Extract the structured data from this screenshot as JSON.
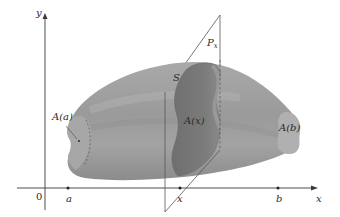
{
  "figure": {
    "type": "solid-with-cross-section",
    "colors": {
      "background": "#ffffff",
      "solid_body": "#9c9c9c",
      "solid_highlight": "#b4b4b4",
      "solid_shadow": "#858585",
      "cross_section": "#7a7a7a",
      "cross_section_light": "#a8a8a8",
      "end_caps": "#aaaaaa",
      "axes": "#3a3a3a",
      "plane_edges": "#555555"
    }
  },
  "axes": {
    "x_label": "x",
    "y_label": "y",
    "origin_label": "0"
  },
  "ticks": [
    {
      "label": "a"
    },
    {
      "label": "x"
    },
    {
      "label": "b"
    }
  ],
  "labels": {
    "solid": "S",
    "plane": "P",
    "plane_subscript": "x",
    "cross_section_area": "A(x)",
    "left_end_area": "A(a)",
    "right_end_area": "A(b)"
  }
}
